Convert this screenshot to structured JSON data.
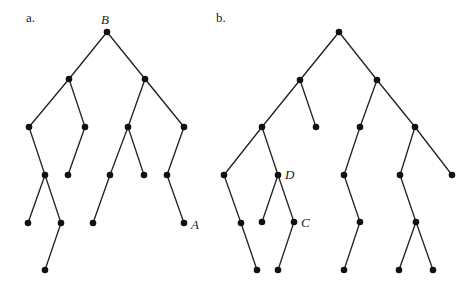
{
  "figure": {
    "panels": [
      {
        "id": "a",
        "label": "a.",
        "label_pos": [
          26,
          22
        ],
        "nodes": [
          {
            "id": "a0",
            "x": 107,
            "y": 32,
            "label": "B",
            "label_pos": [
              101,
              24
            ]
          },
          {
            "id": "a1",
            "x": 69,
            "y": 79
          },
          {
            "id": "a2",
            "x": 145,
            "y": 79
          },
          {
            "id": "a3",
            "x": 29,
            "y": 127
          },
          {
            "id": "a4",
            "x": 85,
            "y": 127
          },
          {
            "id": "a5",
            "x": 128,
            "y": 127
          },
          {
            "id": "a6",
            "x": 184,
            "y": 127
          },
          {
            "id": "a7",
            "x": 45,
            "y": 175
          },
          {
            "id": "a8",
            "x": 68,
            "y": 175
          },
          {
            "id": "a9",
            "x": 110,
            "y": 175
          },
          {
            "id": "a10",
            "x": 144,
            "y": 175
          },
          {
            "id": "a11",
            "x": 167,
            "y": 175
          },
          {
            "id": "a12",
            "x": 28,
            "y": 223
          },
          {
            "id": "a13",
            "x": 61,
            "y": 223
          },
          {
            "id": "a14",
            "x": 93,
            "y": 223
          },
          {
            "id": "a15",
            "x": 184,
            "y": 223,
            "label": "A",
            "label_pos": [
              191,
              229
            ]
          },
          {
            "id": "a16",
            "x": 45,
            "y": 270
          }
        ],
        "edges": [
          [
            "a0",
            "a1"
          ],
          [
            "a0",
            "a2"
          ],
          [
            "a1",
            "a3"
          ],
          [
            "a1",
            "a4"
          ],
          [
            "a2",
            "a5"
          ],
          [
            "a2",
            "a6"
          ],
          [
            "a3",
            "a7"
          ],
          [
            "a4",
            "a8"
          ],
          [
            "a5",
            "a9"
          ],
          [
            "a5",
            "a10"
          ],
          [
            "a6",
            "a11"
          ],
          [
            "a7",
            "a12"
          ],
          [
            "a7",
            "a13"
          ],
          [
            "a9",
            "a14"
          ],
          [
            "a11",
            "a15"
          ],
          [
            "a13",
            "a16"
          ]
        ]
      },
      {
        "id": "b",
        "label": "b.",
        "label_pos": [
          216,
          22
        ],
        "nodes": [
          {
            "id": "b0",
            "x": 339,
            "y": 32
          },
          {
            "id": "b1",
            "x": 300,
            "y": 80
          },
          {
            "id": "b2",
            "x": 377,
            "y": 80
          },
          {
            "id": "b3",
            "x": 262,
            "y": 127
          },
          {
            "id": "b4",
            "x": 316,
            "y": 127
          },
          {
            "id": "b5",
            "x": 360,
            "y": 127
          },
          {
            "id": "b6",
            "x": 415,
            "y": 127
          },
          {
            "id": "b7",
            "x": 224,
            "y": 175
          },
          {
            "id": "b8",
            "x": 278,
            "y": 175,
            "label": "D",
            "label_pos": [
              285,
              179
            ]
          },
          {
            "id": "b9",
            "x": 344,
            "y": 175
          },
          {
            "id": "b10",
            "x": 400,
            "y": 175
          },
          {
            "id": "b11",
            "x": 452,
            "y": 175
          },
          {
            "id": "b12",
            "x": 241,
            "y": 223
          },
          {
            "id": "b13",
            "x": 262,
            "y": 222
          },
          {
            "id": "b14",
            "x": 294,
            "y": 222,
            "label": "C",
            "label_pos": [
              301,
              227
            ]
          },
          {
            "id": "b15",
            "x": 360,
            "y": 222
          },
          {
            "id": "b16",
            "x": 416,
            "y": 222
          },
          {
            "id": "b17",
            "x": 257,
            "y": 270
          },
          {
            "id": "b18",
            "x": 278,
            "y": 270
          },
          {
            "id": "b19",
            "x": 344,
            "y": 270
          },
          {
            "id": "b20",
            "x": 399,
            "y": 270
          },
          {
            "id": "b21",
            "x": 433,
            "y": 270
          }
        ],
        "edges": [
          [
            "b0",
            "b1"
          ],
          [
            "b0",
            "b2"
          ],
          [
            "b1",
            "b3"
          ],
          [
            "b1",
            "b4"
          ],
          [
            "b2",
            "b5"
          ],
          [
            "b2",
            "b6"
          ],
          [
            "b3",
            "b7"
          ],
          [
            "b3",
            "b8"
          ],
          [
            "b5",
            "b9"
          ],
          [
            "b6",
            "b10"
          ],
          [
            "b6",
            "b11"
          ],
          [
            "b7",
            "b12"
          ],
          [
            "b8",
            "b13"
          ],
          [
            "b8",
            "b14"
          ],
          [
            "b9",
            "b15"
          ],
          [
            "b10",
            "b16"
          ],
          [
            "b12",
            "b17"
          ],
          [
            "b14",
            "b18"
          ],
          [
            "b15",
            "b19"
          ],
          [
            "b16",
            "b20"
          ],
          [
            "b16",
            "b21"
          ]
        ]
      }
    ],
    "colors": {
      "ink": "#111111",
      "background": "#ffffff"
    }
  }
}
